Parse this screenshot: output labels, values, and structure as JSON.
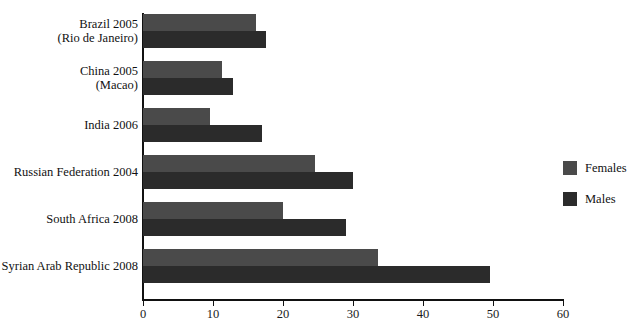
{
  "chart_data": {
    "type": "bar",
    "orientation": "horizontal",
    "title": "",
    "xlabel": "",
    "ylabel": "",
    "xlim": [
      0,
      60
    ],
    "xticks": [
      0,
      10,
      20,
      30,
      40,
      50,
      60
    ],
    "xtick_labels": [
      "0",
      "10",
      "20",
      "30",
      "40",
      "50",
      "60"
    ],
    "grid": false,
    "legend_position": "right",
    "categories": [
      "Brazil 2005\n(Rio de Janeiro)",
      "China 2005\n(Macao)",
      "India 2006",
      "Russian Federation 2004",
      "South Africa 2008",
      "Syrian Arab Republic 2008"
    ],
    "category_lines": [
      [
        "Brazil 2005",
        "(Rio de Janeiro)"
      ],
      [
        "China 2005",
        "(Macao)"
      ],
      [
        "India 2006"
      ],
      [
        "Russian Federation 2004"
      ],
      [
        "South Africa 2008"
      ],
      [
        "Syrian Arab Republic 2008"
      ]
    ],
    "series": [
      {
        "name": "Females",
        "color": "#4a4a4a",
        "values": [
          16.2,
          11.3,
          9.5,
          24.5,
          20.0,
          33.5
        ]
      },
      {
        "name": "Males",
        "color": "#2b2b2b",
        "values": [
          17.6,
          12.8,
          17.0,
          30.0,
          29.0,
          49.5
        ]
      }
    ]
  },
  "legend": {
    "items": [
      {
        "label": "Females",
        "color": "#4a4a4a"
      },
      {
        "label": "Males",
        "color": "#2b2b2b"
      }
    ]
  },
  "axis": {
    "line_color": "#111111"
  }
}
